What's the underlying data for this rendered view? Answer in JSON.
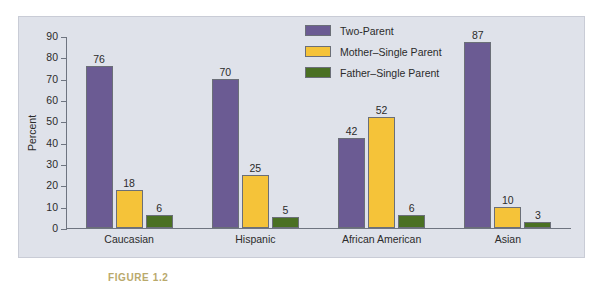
{
  "figure": {
    "caption": "FIGURE 1.2"
  },
  "legend": {
    "position": "top-right",
    "items": [
      {
        "label": "Two-Parent",
        "color": "#6B5B93"
      },
      {
        "label": "Mother–Single Parent",
        "color": "#F5C339"
      },
      {
        "label": "Father–Single Parent",
        "color": "#4A7023"
      }
    ]
  },
  "axes": {
    "y_label": "Percent",
    "y_ticks": [
      "0",
      "10",
      "20",
      "30",
      "40",
      "50",
      "60",
      "70",
      "80",
      "90"
    ],
    "x_label": ""
  },
  "chart_data": {
    "type": "bar",
    "title": "",
    "xlabel": "",
    "ylabel": "Percent",
    "ylim": [
      0,
      90
    ],
    "ytick_step": 10,
    "grid": false,
    "legend_position": "top-right",
    "categories": [
      "Caucasian",
      "Hispanic",
      "African American",
      "Asian"
    ],
    "series": [
      {
        "name": "Two-Parent",
        "color": "#6B5B93",
        "values": [
          76,
          70,
          42,
          87
        ]
      },
      {
        "name": "Mother–Single Parent",
        "color": "#F5C339",
        "values": [
          18,
          25,
          52,
          10
        ]
      },
      {
        "name": "Father–Single Parent",
        "color": "#4A7023",
        "values": [
          6,
          5,
          6,
          3
        ]
      }
    ]
  },
  "style": {
    "panel_background": "#dfe2ea",
    "page_background": "#ffffff",
    "axis_color": "#6e7480",
    "text_color": "#2b2b2b"
  }
}
